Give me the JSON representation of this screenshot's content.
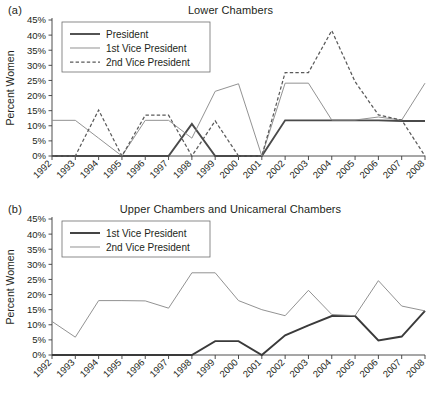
{
  "figure": {
    "ylabel": "Percent Women",
    "years": [
      1992,
      1993,
      1994,
      1995,
      1996,
      1997,
      1998,
      1999,
      2000,
      2001,
      2002,
      2003,
      2004,
      2005,
      2006,
      2007,
      2008
    ],
    "y_ticks": [
      "0%",
      "5%",
      "10%",
      "15%",
      "20%",
      "25%",
      "30%",
      "35%",
      "40%",
      "45%"
    ],
    "colors": {
      "president": "#4a4a4a",
      "first_vp": "#8c8c8c",
      "second_vp": "#5a5a5a",
      "axis": "#3b3b3b",
      "text": "#231f20"
    }
  },
  "panels": [
    {
      "id": "a",
      "label": "(a)",
      "title": "Lower Chambers"
    },
    {
      "id": "b",
      "label": "(b)",
      "title": "Upper Chambers and Unicameral Chambers"
    }
  ],
  "chart_data": [
    {
      "type": "line",
      "panel": "a",
      "title": "Lower Chambers",
      "xlabel": "",
      "ylabel": "Percent Women",
      "x": [
        1992,
        1993,
        1994,
        1995,
        1996,
        1997,
        1998,
        1999,
        2000,
        2001,
        2002,
        2003,
        2004,
        2005,
        2006,
        2007,
        2008
      ],
      "xlim": [
        1992,
        2008
      ],
      "ylim": [
        0,
        45
      ],
      "ytick_step": 5,
      "grid": false,
      "legend_position": "top-left",
      "series": [
        {
          "name": "President",
          "style": "solid-thick",
          "color": "#4a4a4a",
          "values": [
            0,
            0,
            0,
            0,
            0,
            0,
            10.6,
            0,
            0,
            0,
            11.8,
            11.8,
            11.8,
            11.8,
            11.8,
            11.6,
            11.6
          ]
        },
        {
          "name": "1st Vice President",
          "style": "solid-thin",
          "color": "#8c8c8c",
          "values": [
            11.8,
            11.8,
            5.9,
            0,
            11.8,
            11.8,
            5.9,
            21.4,
            23.9,
            0,
            24.1,
            24.1,
            11.9,
            11.9,
            12.9,
            11.9,
            24.1
          ]
        },
        {
          "name": "2nd Vice President",
          "style": "dashed",
          "color": "#5a5a5a",
          "values": [
            0,
            0,
            15.2,
            0,
            13.5,
            13.5,
            0,
            11.6,
            0,
            0,
            27.6,
            27.6,
            41.5,
            24.6,
            13.6,
            11.9,
            0
          ]
        }
      ]
    },
    {
      "type": "line",
      "panel": "b",
      "title": "Upper Chambers and Unicameral Chambers",
      "xlabel": "",
      "ylabel": "Percent Women",
      "x": [
        1992,
        1993,
        1994,
        1995,
        1996,
        1997,
        1998,
        1999,
        2000,
        2001,
        2002,
        2003,
        2004,
        2005,
        2006,
        2007,
        2008
      ],
      "xlim": [
        1992,
        2008
      ],
      "ylim": [
        0,
        45
      ],
      "ytick_step": 5,
      "grid": false,
      "legend_position": "top-left",
      "series": [
        {
          "name": "1st Vice President",
          "style": "solid-thick",
          "color": "#3a3a3a",
          "values": [
            0,
            0,
            0,
            0,
            0,
            0,
            0,
            4.6,
            4.6,
            0,
            6.5,
            9.8,
            12.9,
            12.9,
            4.8,
            6.1,
            14.6
          ]
        },
        {
          "name": "2nd Vice President",
          "style": "solid-thin",
          "color": "#8c8c8c",
          "values": [
            11.1,
            5.9,
            18.0,
            18.0,
            17.9,
            15.5,
            27.2,
            27.2,
            18.0,
            15.0,
            13.0,
            21.4,
            13.4,
            13.0,
            24.6,
            16.2,
            14.6
          ]
        }
      ]
    }
  ]
}
